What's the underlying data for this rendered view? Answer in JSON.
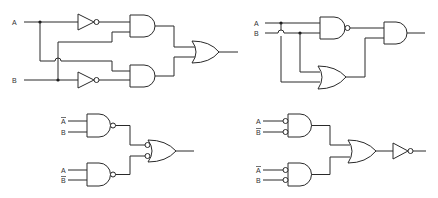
{
  "diagram": {
    "type": "logic-circuits",
    "circuits": [
      {
        "id": "circuit-1",
        "position": "top-left",
        "inputs": [
          {
            "label": "A",
            "negated": false
          },
          {
            "label": "B",
            "negated": false
          }
        ],
        "gates": [
          "NOT (A)",
          "NOT (B)",
          "AND (A', B)",
          "AND (A, B')",
          "OR"
        ],
        "description": "XOR built from two inverters, two AND gates and an OR gate"
      },
      {
        "id": "circuit-2",
        "position": "top-right",
        "inputs": [
          {
            "label": "A",
            "negated": false
          },
          {
            "label": "B",
            "negated": false
          }
        ],
        "gates": [
          "NAND (A, B)",
          "OR (A, B)",
          "AND"
        ],
        "description": "XOR built from NAND, OR and AND gates"
      },
      {
        "id": "circuit-3",
        "position": "bottom-left",
        "inputs": [
          {
            "label": "A",
            "negated": true
          },
          {
            "label": "B",
            "negated": false
          },
          {
            "label": "A",
            "negated": false
          },
          {
            "label": "B",
            "negated": true
          }
        ],
        "gates": [
          "NAND (A', B)",
          "NAND (A, B')",
          "OR with inverted inputs"
        ],
        "description": "Two NAND gates feeding a negative-input OR gate"
      },
      {
        "id": "circuit-4",
        "position": "bottom-right",
        "inputs": [
          {
            "label": "A",
            "negated": false
          },
          {
            "label": "B",
            "negated": true
          },
          {
            "label": "A",
            "negated": true
          },
          {
            "label": "B",
            "negated": false
          }
        ],
        "gates": [
          "AND with inverted inputs",
          "AND with inverted inputs",
          "OR",
          "NOT"
        ],
        "description": "Two negative-input AND gates feeding an OR gate followed by an inverter"
      }
    ]
  },
  "labels": {
    "c1_a": "A",
    "c1_b": "B",
    "c2_a": "A",
    "c2_b": "B",
    "c3_in1": "A",
    "c3_in2": "B",
    "c3_in3": "A",
    "c3_in4": "B",
    "c4_in1": "A",
    "c4_in2": "B",
    "c4_in3": "A",
    "c4_in4": "B"
  },
  "colors": {
    "line": "#2a2a2a",
    "background": "#ffffff"
  }
}
